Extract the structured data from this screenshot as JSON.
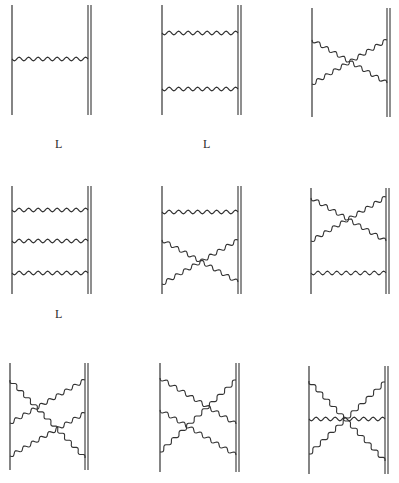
{
  "figure": {
    "line_color": "#333333",
    "labels": [
      {
        "text": "L",
        "x": 55,
        "y": 137
      },
      {
        "text": "L",
        "x": 203,
        "y": 137
      },
      {
        "text": "L",
        "x": 55,
        "y": 307
      }
    ],
    "diagrams": [
      {
        "id": "ladder-1",
        "left_x": 12,
        "right_x": 88,
        "y_top": 5,
        "y_bottom": 115,
        "lines": [
          {
            "from": [
              12,
              59
            ],
            "to": [
              88,
              59
            ]
          }
        ]
      },
      {
        "id": "ladder-2",
        "left_x": 162,
        "right_x": 238,
        "y_top": 5,
        "y_bottom": 115,
        "lines": [
          {
            "from": [
              162,
              33
            ],
            "to": [
              238,
              33
            ]
          },
          {
            "from": [
              162,
              89
            ],
            "to": [
              238,
              89
            ]
          }
        ]
      },
      {
        "id": "crossed-2",
        "left_x": 312,
        "right_x": 387,
        "y_top": 8,
        "y_bottom": 117,
        "lines": [
          {
            "from": [
              312,
              40
            ],
            "to": [
              387,
              83
            ]
          },
          {
            "from": [
              312,
              84
            ],
            "to": [
              387,
              40
            ]
          }
        ]
      },
      {
        "id": "ladder-3",
        "left_x": 12,
        "right_x": 88,
        "y_top": 186,
        "y_bottom": 294,
        "lines": [
          {
            "from": [
              12,
              210
            ],
            "to": [
              88,
              210
            ]
          },
          {
            "from": [
              12,
              241
            ],
            "to": [
              88,
              241
            ]
          },
          {
            "from": [
              12,
              273
            ],
            "to": [
              88,
              273
            ]
          }
        ]
      },
      {
        "id": "ladder-crossed-lower",
        "left_x": 162,
        "right_x": 238,
        "y_top": 186,
        "y_bottom": 294,
        "lines": [
          {
            "from": [
              162,
              212
            ],
            "to": [
              238,
              212
            ]
          },
          {
            "from": [
              162,
              240
            ],
            "to": [
              238,
              282
            ]
          },
          {
            "from": [
              162,
              284
            ],
            "to": [
              238,
              240
            ]
          }
        ]
      },
      {
        "id": "crossed-upper-ladder",
        "left_x": 311,
        "right_x": 386,
        "y_top": 188,
        "y_bottom": 294,
        "lines": [
          {
            "from": [
              311,
              198
            ],
            "to": [
              386,
              241
            ]
          },
          {
            "from": [
              311,
              241
            ],
            "to": [
              386,
              197
            ]
          },
          {
            "from": [
              311,
              273
            ],
            "to": [
              386,
              273
            ]
          }
        ]
      },
      {
        "id": "triple-cross-a",
        "left_x": 10,
        "right_x": 85,
        "y_top": 363,
        "y_bottom": 470,
        "lines": [
          {
            "from": [
              10,
              380
            ],
            "to": [
              85,
              458
            ]
          },
          {
            "from": [
              10,
              423
            ],
            "to": [
              85,
              380
            ]
          },
          {
            "from": [
              10,
              456
            ],
            "to": [
              85,
              413
            ]
          }
        ]
      },
      {
        "id": "triple-cross-b",
        "left_x": 160,
        "right_x": 236,
        "y_top": 363,
        "y_bottom": 472,
        "lines": [
          {
            "from": [
              160,
              378
            ],
            "to": [
              236,
              424
            ]
          },
          {
            "from": [
              160,
              410
            ],
            "to": [
              236,
              455
            ]
          },
          {
            "from": [
              160,
              452
            ],
            "to": [
              236,
              380
            ]
          }
        ]
      },
      {
        "id": "triple-cross-c",
        "left_x": 309,
        "right_x": 385,
        "y_top": 366,
        "y_bottom": 474,
        "lines": [
          {
            "from": [
              309,
              381
            ],
            "to": [
              385,
              461
            ]
          },
          {
            "from": [
              309,
              419
            ],
            "to": [
              385,
              419
            ]
          },
          {
            "from": [
              309,
              454
            ],
            "to": [
              385,
              382
            ]
          }
        ]
      }
    ]
  }
}
